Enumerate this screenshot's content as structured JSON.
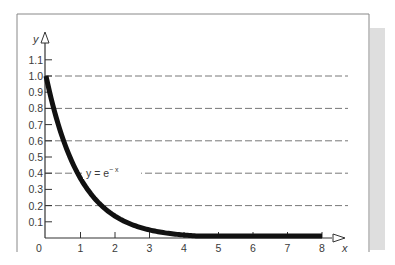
{
  "chart_data": {
    "type": "line",
    "title": "",
    "xlabel": "x",
    "ylabel": "y",
    "xlim": [
      0,
      8
    ],
    "ylim": [
      0,
      1.1
    ],
    "x_ticks": [
      "0",
      "1",
      "2",
      "3",
      "4",
      "5",
      "6",
      "7",
      "8"
    ],
    "y_ticks": [
      "0.1",
      "0.2",
      "0.3",
      "0.4",
      "0.5",
      "0.6",
      "0.7",
      "0.8",
      "0.9",
      "1.0",
      "1.1"
    ],
    "grid": {
      "on": true,
      "style": "dashed",
      "y_values": [
        0.2,
        0.4,
        0.6,
        0.8,
        1.0
      ]
    },
    "legend": "none",
    "series": [
      {
        "name": "y = e^-x",
        "x": [
          0,
          0.5,
          1,
          1.5,
          2,
          2.5,
          3,
          3.5,
          4,
          5,
          6,
          7,
          8
        ],
        "values": [
          1.0,
          0.607,
          0.368,
          0.223,
          0.135,
          0.082,
          0.05,
          0.03,
          0.018,
          0.007,
          0.002,
          0.001,
          0.0003
        ]
      }
    ],
    "annotations": [
      {
        "text": "y = e",
        "superscript": "−x",
        "x": 1.2,
        "y": 0.4
      }
    ]
  },
  "labels": {
    "y_axis": "y",
    "x_axis": "x",
    "origin": "0",
    "curve_main": "y = e",
    "curve_sup": "− x"
  },
  "colors": {
    "curve": "#111111",
    "axis": "#333333",
    "grid": "#555555",
    "frame": "#888888",
    "shadow": "#dcdcdc"
  }
}
